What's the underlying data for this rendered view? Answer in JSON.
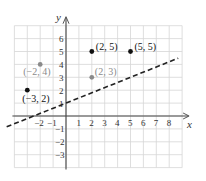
{
  "chart_data": {
    "type": "scatter",
    "title": "",
    "xlabel": "x",
    "ylabel": "y",
    "xlim": [
      -4,
      9
    ],
    "ylim": [
      -4,
      7
    ],
    "grid": true,
    "x_ticks": [
      -2,
      -1,
      1,
      2,
      3,
      4,
      5,
      6,
      7,
      8
    ],
    "y_ticks": [
      -3,
      -2,
      -1,
      1,
      2,
      3,
      4,
      5,
      6
    ],
    "line": {
      "style": "dashed",
      "equation": "y = 0.4x + 1",
      "slope": 0.4,
      "intercept": 1,
      "color": "#222222"
    },
    "series": [
      {
        "name": "black points",
        "color": "#111111",
        "points": [
          {
            "x": 2,
            "y": 5,
            "label": "(2, 5)"
          },
          {
            "x": 5,
            "y": 5,
            "label": "(5, 5)"
          },
          {
            "x": -3,
            "y": 2,
            "label": "(−3, 2)"
          }
        ]
      },
      {
        "name": "gray points",
        "color": "#8a8a8a",
        "points": [
          {
            "x": -2,
            "y": 4,
            "label": "(−2, 4)"
          },
          {
            "x": 2,
            "y": 3,
            "label": "(2, 3)"
          }
        ]
      }
    ]
  }
}
